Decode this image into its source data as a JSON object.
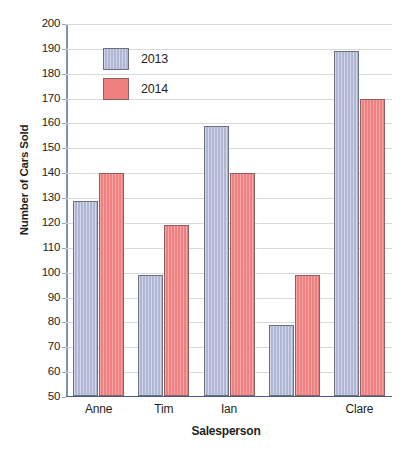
{
  "chart_data": {
    "type": "bar",
    "title": "",
    "xlabel": "Salesperson",
    "ylabel": "Number of Cars Sold",
    "categories": [
      "Anne",
      "Tim",
      "Ian",
      "",
      "Clare"
    ],
    "series": [
      {
        "name": "2013",
        "color": "#aeb6d4",
        "values": [
          129,
          99,
          159,
          79,
          189
        ]
      },
      {
        "name": "2014",
        "color": "#f08080",
        "values": [
          140,
          119,
          140,
          99,
          170
        ]
      }
    ],
    "ylim": [
      50,
      200
    ],
    "ytick_step": 10,
    "yticks": [
      200,
      190,
      180,
      170,
      160,
      150,
      140,
      130,
      120,
      110,
      100,
      90,
      80,
      70,
      60,
      50
    ],
    "grid": true,
    "legend_position": "upper-left-inside",
    "legend": [
      {
        "label": "2013",
        "color": "#aeb6d4"
      },
      {
        "label": "2014",
        "color": "#f08080"
      }
    ]
  },
  "axis": {
    "y_title": "Number of Cars Sold",
    "x_title": "Salesperson"
  },
  "colors": {
    "series_2013": "#aeb6d4",
    "series_2014": "#f08080",
    "gridline": "#d9d9d9",
    "axis": "#4a5d8a",
    "text": "#231f20"
  }
}
